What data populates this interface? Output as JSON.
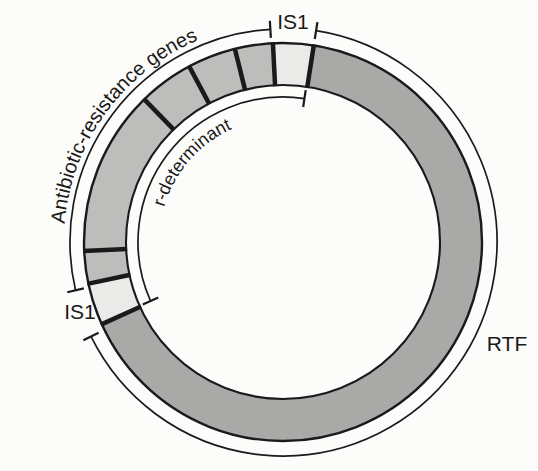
{
  "figure": {
    "type": "circular-plasmid-map",
    "labels": {
      "is1_top": "IS1",
      "is1_left": "IS1",
      "rtf": "RTF",
      "antibiotic_genes": "Antibiotic-resistance genes",
      "r_determinant": "r-determinant"
    },
    "colors": {
      "background": "#fcfcfa",
      "rtf_fill": "#a9a9a7",
      "gene_fill": "#bdbdbb",
      "is1_fill": "#eaeae8",
      "line": "#1a1a1a"
    },
    "map": {
      "regions": [
        {
          "name": "IS1 insertion element (top copy)",
          "type": "is1",
          "start_deg": 81.1,
          "end_deg": 92.9
        },
        {
          "name": "antibiotic-resistance gene 1",
          "type": "gene",
          "start_deg": 92.9,
          "end_deg": 104.0
        },
        {
          "name": "antibiotic-resistance gene 2",
          "type": "gene",
          "start_deg": 104.0,
          "end_deg": 118.1
        },
        {
          "name": "antibiotic-resistance gene 3",
          "type": "gene",
          "start_deg": 118.1,
          "end_deg": 134.2
        },
        {
          "name": "antibiotic-resistance gene 4",
          "type": "gene",
          "start_deg": 134.2,
          "end_deg": 182.6
        },
        {
          "name": "antibiotic-resistance gene 5",
          "type": "gene",
          "start_deg": 182.6,
          "end_deg": 192.1
        },
        {
          "name": "IS1 insertion element (left copy)",
          "type": "is1",
          "start_deg": 192.1,
          "end_deg": 204.4
        },
        {
          "name": "RTF (resistance transfer factor)",
          "type": "rtf",
          "start_deg": 204.4,
          "end_deg": 441.1
        }
      ],
      "brackets": [
        {
          "id": "antibiotic-genes-bracket",
          "radius": 213,
          "start_deg": 93.4,
          "end_deg": 193.1
        },
        {
          "id": "rtf-bracket",
          "radius": 214,
          "start_deg": -153.8,
          "end_deg": 81.1
        },
        {
          "id": "r-determinant-bracket",
          "radius": 145,
          "start_deg": 81.5,
          "end_deg": 204.0
        }
      ]
    }
  }
}
